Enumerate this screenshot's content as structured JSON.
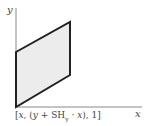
{
  "diagram": {
    "axes": {
      "x_label": "x",
      "y_label": "y"
    },
    "shape": {
      "type": "parallelogram",
      "fill": "#ececec",
      "stroke": "#222222"
    },
    "formula": {
      "open": "[",
      "x": "x",
      "sep1": ", (",
      "y": "y",
      "plus": " + SH",
      "sub": "y",
      "dot": " · ",
      "x2": "x",
      "close": "), 1]"
    }
  }
}
